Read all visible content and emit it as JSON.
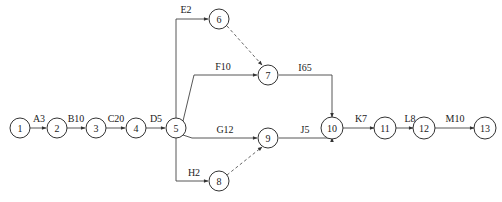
{
  "diagram": {
    "type": "activity-on-arrow network",
    "nodes": [
      {
        "id": "1",
        "x": 20,
        "y": 128
      },
      {
        "id": "2",
        "x": 57,
        "y": 128
      },
      {
        "id": "3",
        "x": 96,
        "y": 128
      },
      {
        "id": "4",
        "x": 136,
        "y": 128
      },
      {
        "id": "5",
        "x": 176,
        "y": 128
      },
      {
        "id": "6",
        "x": 219,
        "y": 19
      },
      {
        "id": "7",
        "x": 268,
        "y": 75
      },
      {
        "id": "8",
        "x": 219,
        "y": 181
      },
      {
        "id": "9",
        "x": 268,
        "y": 138
      },
      {
        "id": "10",
        "x": 332,
        "y": 128
      },
      {
        "id": "11",
        "x": 385,
        "y": 128
      },
      {
        "id": "12",
        "x": 424,
        "y": 128
      },
      {
        "id": "13",
        "x": 485,
        "y": 128
      }
    ],
    "activities": [
      {
        "label": "A3",
        "from": "1",
        "to": "2"
      },
      {
        "label": "B10",
        "from": "2",
        "to": "3"
      },
      {
        "label": "C20",
        "from": "3",
        "to": "4"
      },
      {
        "label": "D5",
        "from": "4",
        "to": "5"
      },
      {
        "label": "E2",
        "from": "5",
        "to": "6"
      },
      {
        "label": "F10",
        "from": "5",
        "to": "7"
      },
      {
        "label": "G12",
        "from": "5",
        "to": "9"
      },
      {
        "label": "H2",
        "from": "5",
        "to": "8"
      },
      {
        "label": "I65",
        "from": "7",
        "to": "10"
      },
      {
        "label": "J5",
        "from": "9",
        "to": "10"
      },
      {
        "label": "K7",
        "from": "10",
        "to": "11"
      },
      {
        "label": "L8",
        "from": "11",
        "to": "12"
      },
      {
        "label": "M10",
        "from": "12",
        "to": "13"
      }
    ],
    "dummy_activities": [
      {
        "from": "6",
        "to": "7"
      },
      {
        "from": "8",
        "to": "9"
      }
    ]
  }
}
